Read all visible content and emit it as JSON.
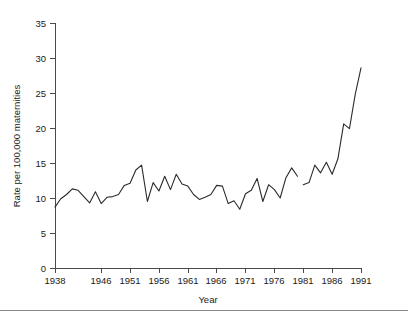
{
  "chart_data": {
    "type": "line",
    "title": "",
    "subtitle": "",
    "xlabel": "Year",
    "ylabel": "Rate per 100,000 maternities",
    "xlim": [
      1938,
      1991
    ],
    "ylim": [
      0,
      35
    ],
    "grid": false,
    "legend": "none",
    "xticks": [
      1938,
      1946,
      1951,
      1956,
      1961,
      1966,
      1971,
      1976,
      1981,
      1986,
      1991
    ],
    "xtick_labels": [
      "1938",
      "1946",
      "1951",
      "1956",
      "1961",
      "1966",
      "1971",
      "1976",
      "1981",
      "1986",
      "1991"
    ],
    "yticks": [
      0,
      5,
      10,
      15,
      20,
      25,
      30,
      35
    ],
    "ytick_labels": [
      "0",
      "5",
      "10",
      "15",
      "20",
      "25",
      "30",
      "35"
    ],
    "series": [
      {
        "name": "Rate 1938-1980",
        "x": [
          1938,
          1939,
          1940,
          1941,
          1942,
          1943,
          1944,
          1945,
          1946,
          1947,
          1948,
          1949,
          1950,
          1951,
          1952,
          1953,
          1954,
          1955,
          1956,
          1957,
          1958,
          1959,
          1960,
          1961,
          1962,
          1963,
          1964,
          1965,
          1966,
          1967,
          1968,
          1969,
          1970,
          1971,
          1972,
          1973,
          1974,
          1975,
          1976,
          1977,
          1978,
          1979,
          1980
        ],
        "values": [
          8.7,
          9.9,
          10.5,
          11.3,
          11.1,
          10.2,
          9.3,
          10.9,
          9.2,
          10.1,
          10.2,
          10.5,
          11.8,
          12.1,
          14.0,
          14.7,
          9.5,
          12.2,
          11.0,
          13.1,
          11.2,
          13.4,
          12.0,
          11.7,
          10.5,
          9.8,
          10.1,
          10.5,
          11.8,
          11.7,
          9.2,
          9.6,
          8.4,
          10.6,
          11.1,
          12.8,
          9.5,
          11.9,
          11.2,
          10.0,
          12.9,
          14.3,
          13.1
        ]
      },
      {
        "name": "Rate 1981-1991",
        "x": [
          1981,
          1982,
          1983,
          1984,
          1985,
          1986,
          1987,
          1988,
          1989,
          1990,
          1991
        ],
        "values": [
          11.9,
          12.2,
          14.7,
          13.6,
          15.1,
          13.4,
          15.6,
          20.6,
          19.9,
          24.8,
          28.6
        ]
      }
    ],
    "series_break_note": "line is broken between 1980 and 1981"
  },
  "footer": {
    "rule": true
  }
}
